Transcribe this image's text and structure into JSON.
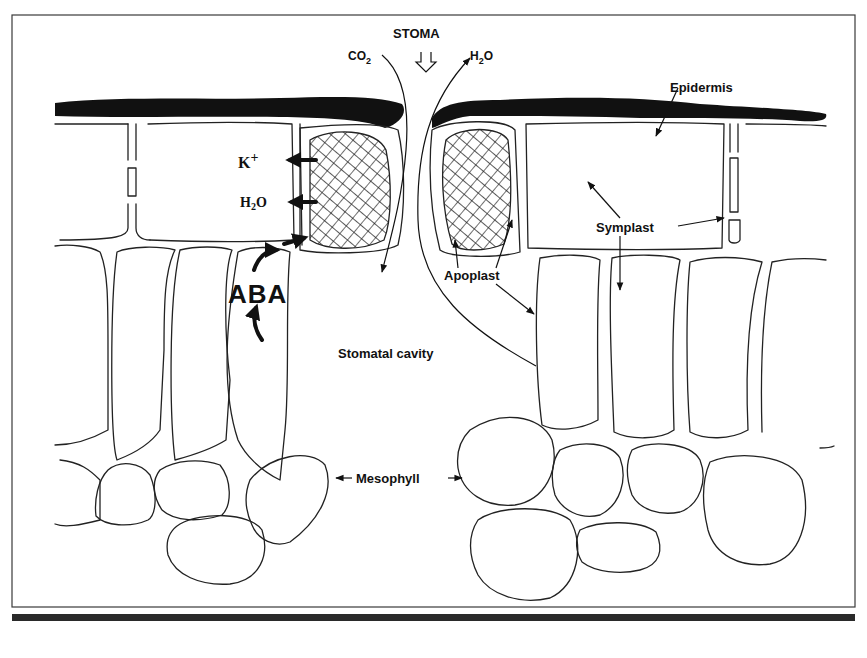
{
  "diagram": {
    "title_label": "STOMA",
    "gas_labels": {
      "co2": "CO",
      "co2_sub": "2",
      "h2o_main": "H",
      "h2o_sub": "2",
      "h2o_tail": "O"
    },
    "guard_cell_fluxes": {
      "potassium": "K",
      "potassium_sup": "+",
      "water": "H",
      "water_sub": "2",
      "water_tail": "O"
    },
    "hormone_label": "ABA",
    "tissue_labels": {
      "epidermis": "Epidermis",
      "symplast": "Symplast",
      "apoplast": "Apoplast",
      "stomatal_cavity": "Stomatal cavity",
      "mesophyll": "Mesophyll"
    },
    "colors": {
      "ink": "#111111",
      "background": "#ffffff",
      "bottom_bar": "#2a2a2a"
    }
  }
}
